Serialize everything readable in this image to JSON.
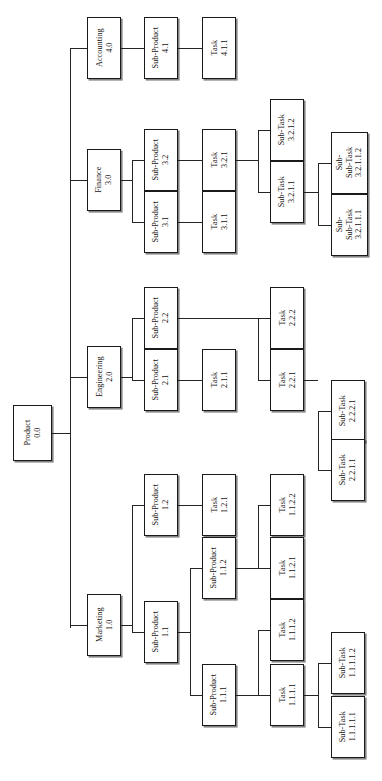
{
  "diagram": {
    "orientation": "horizontal-rotated-labels",
    "line_color": "#242424",
    "box_border_color": "#1a1a1a",
    "box_fill_color": "#ffffff",
    "text_color": "#14100e"
  },
  "nodes": [
    {
      "id": "n0",
      "label": "Product",
      "code": "0.0",
      "x": 13,
      "y": 405,
      "w": 39,
      "h": 56,
      "level": 0
    },
    {
      "id": "n40",
      "label": "Accounting",
      "code": "4.0",
      "x": 87,
      "y": 17,
      "w": 34,
      "h": 62,
      "level": 1
    },
    {
      "id": "n41",
      "label": "Sub-Product",
      "code": "4.1",
      "x": 144,
      "y": 17,
      "w": 34,
      "h": 62,
      "level": 2
    },
    {
      "id": "n411",
      "label": "Task",
      "code": "4.1.1",
      "x": 202,
      "y": 17,
      "w": 34,
      "h": 62,
      "level": 3
    },
    {
      "id": "n30",
      "label": "Finance",
      "code": "3.0",
      "x": 87,
      "y": 149,
      "w": 34,
      "h": 62,
      "level": 1
    },
    {
      "id": "n32",
      "label": "Sub-Product",
      "code": "3.2",
      "x": 144,
      "y": 129,
      "w": 34,
      "h": 62,
      "level": 2
    },
    {
      "id": "n31",
      "label": "Sub-Product",
      "code": "3.1",
      "x": 144,
      "y": 191,
      "w": 34,
      "h": 62,
      "level": 2
    },
    {
      "id": "n321",
      "label": "Task",
      "code": "3.2.1",
      "x": 202,
      "y": 129,
      "w": 34,
      "h": 62,
      "level": 3
    },
    {
      "id": "n311",
      "label": "Task",
      "code": "3.1.1",
      "x": 202,
      "y": 191,
      "w": 34,
      "h": 62,
      "level": 3
    },
    {
      "id": "n3212",
      "label": "Sub-Task",
      "code": "3.2.1.2",
      "x": 270,
      "y": 99,
      "w": 34,
      "h": 62,
      "level": 4
    },
    {
      "id": "n3211",
      "label": "Sub-Task",
      "code": "3.2.1.1",
      "x": 270,
      "y": 161,
      "w": 34,
      "h": 62,
      "level": 4
    },
    {
      "id": "n32112",
      "label": "Sub-\nSub-Task",
      "code": "3.2.1.1.2",
      "x": 331,
      "y": 132,
      "w": 37,
      "h": 62,
      "level": 5
    },
    {
      "id": "n32111",
      "label": "Sub-\nSub-Task",
      "code": "3.2.1.1.1",
      "x": 331,
      "y": 194,
      "w": 37,
      "h": 62,
      "level": 5
    },
    {
      "id": "n20",
      "label": "Engineering",
      "code": "2.0",
      "x": 87,
      "y": 346,
      "w": 34,
      "h": 62,
      "level": 1
    },
    {
      "id": "n22",
      "label": "Sub-Product",
      "code": "2.2",
      "x": 144,
      "y": 287,
      "w": 34,
      "h": 62,
      "level": 2
    },
    {
      "id": "n21",
      "label": "Sub-Product",
      "code": "2.1",
      "x": 144,
      "y": 349,
      "w": 34,
      "h": 62,
      "level": 2
    },
    {
      "id": "n211",
      "label": "Task",
      "code": "2.1.1",
      "x": 202,
      "y": 349,
      "w": 34,
      "h": 62,
      "level": 3
    },
    {
      "id": "n222",
      "label": "Task",
      "code": "2.2.2",
      "x": 270,
      "y": 287,
      "w": 34,
      "h": 62,
      "level": 4
    },
    {
      "id": "n221",
      "label": "Task",
      "code": "2.2.1",
      "x": 270,
      "y": 349,
      "w": 34,
      "h": 62,
      "level": 4
    },
    {
      "id": "n2221",
      "label": "Sub-Task",
      "code": "2.2.2.1",
      "x": 331,
      "y": 380,
      "w": 34,
      "h": 62,
      "level": 5
    },
    {
      "id": "n2211",
      "label": "Sub-Task",
      "code": "2.2.1.1",
      "x": 331,
      "y": 439,
      "w": 34,
      "h": 62,
      "level": 5
    },
    {
      "id": "n10",
      "label": "Marketing",
      "code": "1.0",
      "x": 87,
      "y": 594,
      "w": 34,
      "h": 62,
      "level": 1
    },
    {
      "id": "n12",
      "label": "Sub-Product",
      "code": "1.2",
      "x": 144,
      "y": 474,
      "w": 34,
      "h": 62,
      "level": 2
    },
    {
      "id": "n11",
      "label": "Sub-Product",
      "code": "1.1",
      "x": 144,
      "y": 601,
      "w": 34,
      "h": 62,
      "level": 2
    },
    {
      "id": "n121",
      "label": "Task",
      "code": "1.2.1",
      "x": 202,
      "y": 474,
      "w": 34,
      "h": 62,
      "level": 3
    },
    {
      "id": "n112",
      "label": "Sub-Product",
      "code": "1.1.2",
      "x": 202,
      "y": 537,
      "w": 34,
      "h": 62,
      "level": 3
    },
    {
      "id": "n111",
      "label": "Sub-Product",
      "code": "1.1.1",
      "x": 202,
      "y": 664,
      "w": 34,
      "h": 62,
      "level": 3
    },
    {
      "id": "n1122",
      "label": "Task",
      "code": "1.1.2.2",
      "x": 270,
      "y": 474,
      "w": 34,
      "h": 62,
      "level": 4
    },
    {
      "id": "n1121",
      "label": "Task",
      "code": "1.1.2.1",
      "x": 270,
      "y": 537,
      "w": 34,
      "h": 62,
      "level": 4
    },
    {
      "id": "n1112",
      "label": "Task",
      "code": "1.1.1.2",
      "x": 270,
      "y": 599,
      "w": 34,
      "h": 62,
      "level": 4
    },
    {
      "id": "n1111",
      "label": "Task",
      "code": "1.1.1.1",
      "x": 270,
      "y": 664,
      "w": 34,
      "h": 62,
      "level": 4
    },
    {
      "id": "n11112",
      "label": "Sub-Task",
      "code": "1.1.1.1.2",
      "x": 331,
      "y": 632,
      "w": 34,
      "h": 62,
      "level": 5
    },
    {
      "id": "n11111",
      "label": "Sub-Task",
      "code": "1.1.1.1.1",
      "x": 331,
      "y": 696,
      "w": 34,
      "h": 62,
      "level": 5
    }
  ],
  "edges": [
    {
      "id": "e-root-trunk-v",
      "type": "v",
      "x": 70,
      "y": 48,
      "len": 580
    },
    {
      "id": "e-root-stub",
      "type": "h",
      "x": 52,
      "y": 433,
      "len": 18
    },
    {
      "id": "e-acct-in",
      "type": "h",
      "x": 70,
      "y": 48,
      "len": 17
    },
    {
      "id": "e-acct-41",
      "type": "h",
      "x": 121,
      "y": 48,
      "len": 23
    },
    {
      "id": "e-41-411",
      "type": "h",
      "x": 178,
      "y": 48,
      "len": 24
    },
    {
      "id": "e-fin-in",
      "type": "h",
      "x": 70,
      "y": 180,
      "len": 17
    },
    {
      "id": "e-fin-out",
      "type": "h",
      "x": 121,
      "y": 180,
      "len": 11
    },
    {
      "id": "e-fin-v",
      "type": "v",
      "x": 132,
      "y": 160,
      "len": 62
    },
    {
      "id": "e-fin-32",
      "type": "h",
      "x": 132,
      "y": 160,
      "len": 12
    },
    {
      "id": "e-fin-31",
      "type": "h",
      "x": 132,
      "y": 222,
      "len": 12
    },
    {
      "id": "e-32-321",
      "type": "h",
      "x": 178,
      "y": 160,
      "len": 24
    },
    {
      "id": "e-31-311",
      "type": "h",
      "x": 178,
      "y": 222,
      "len": 24
    },
    {
      "id": "e-321-out",
      "type": "h",
      "x": 236,
      "y": 160,
      "len": 22
    },
    {
      "id": "e-321-v",
      "type": "v",
      "x": 258,
      "y": 130,
      "len": 62
    },
    {
      "id": "e-321-3212",
      "type": "h",
      "x": 258,
      "y": 130,
      "len": 12
    },
    {
      "id": "e-321-3211",
      "type": "h",
      "x": 258,
      "y": 192,
      "len": 12
    },
    {
      "id": "e-3211-out",
      "type": "h",
      "x": 304,
      "y": 192,
      "len": 14
    },
    {
      "id": "e-3211-v",
      "type": "v",
      "x": 318,
      "y": 163,
      "len": 62
    },
    {
      "id": "e-3211-c2",
      "type": "h",
      "x": 318,
      "y": 163,
      "len": 13
    },
    {
      "id": "e-3211-c1",
      "type": "h",
      "x": 318,
      "y": 225,
      "len": 13
    },
    {
      "id": "e-eng-in",
      "type": "h",
      "x": 70,
      "y": 377,
      "len": 17
    },
    {
      "id": "e-eng-out",
      "type": "h",
      "x": 121,
      "y": 377,
      "len": 11
    },
    {
      "id": "e-eng-v",
      "type": "v",
      "x": 132,
      "y": 318,
      "len": 62
    },
    {
      "id": "e-eng-22",
      "type": "h",
      "x": 132,
      "y": 318,
      "len": 12
    },
    {
      "id": "e-eng-21",
      "type": "h",
      "x": 132,
      "y": 380,
      "len": 12
    },
    {
      "id": "e-21-211",
      "type": "h",
      "x": 178,
      "y": 380,
      "len": 24
    },
    {
      "id": "e-22-out",
      "type": "h",
      "x": 178,
      "y": 318,
      "len": 80
    },
    {
      "id": "e-22-v",
      "type": "v",
      "x": 258,
      "y": 318,
      "len": 62
    },
    {
      "id": "e-22-222",
      "type": "h",
      "x": 258,
      "y": 318,
      "len": 12
    },
    {
      "id": "e-22-221",
      "type": "h",
      "x": 258,
      "y": 380,
      "len": 12
    },
    {
      "id": "e-221-out",
      "type": "h",
      "x": 304,
      "y": 380,
      "len": 14
    },
    {
      "id": "e-221-v",
      "type": "v",
      "x": 318,
      "y": 411,
      "len": 59
    },
    {
      "id": "e-221-2221",
      "type": "h",
      "x": 318,
      "y": 411,
      "len": 13
    },
    {
      "id": "e-221-2211",
      "type": "h",
      "x": 318,
      "y": 470,
      "len": 13
    },
    {
      "id": "e-mkt-in",
      "type": "h",
      "x": 70,
      "y": 625,
      "len": 17
    },
    {
      "id": "e-mkt-out",
      "type": "h",
      "x": 121,
      "y": 625,
      "len": 11
    },
    {
      "id": "e-mkt-v",
      "type": "v",
      "x": 132,
      "y": 505,
      "len": 127
    },
    {
      "id": "e-mkt-12",
      "type": "h",
      "x": 132,
      "y": 505,
      "len": 12
    },
    {
      "id": "e-mkt-11",
      "type": "h",
      "x": 132,
      "y": 632,
      "len": 12
    },
    {
      "id": "e-12-121",
      "type": "h",
      "x": 178,
      "y": 505,
      "len": 24
    },
    {
      "id": "e-11-out",
      "type": "h",
      "x": 178,
      "y": 632,
      "len": 12
    },
    {
      "id": "e-11-v",
      "type": "v",
      "x": 190,
      "y": 568,
      "len": 127
    },
    {
      "id": "e-11-112",
      "type": "h",
      "x": 190,
      "y": 568,
      "len": 12
    },
    {
      "id": "e-11-111",
      "type": "h",
      "x": 190,
      "y": 695,
      "len": 12
    },
    {
      "id": "e-112-out",
      "type": "h",
      "x": 236,
      "y": 568,
      "len": 22
    },
    {
      "id": "e-112-v",
      "type": "v",
      "x": 258,
      "y": 505,
      "len": 63
    },
    {
      "id": "e-112-1122",
      "type": "h",
      "x": 258,
      "y": 505,
      "len": 12
    },
    {
      "id": "e-112-1121",
      "type": "h",
      "x": 258,
      "y": 568,
      "len": 12
    },
    {
      "id": "e-111-out",
      "type": "h",
      "x": 236,
      "y": 695,
      "len": 22
    },
    {
      "id": "e-111-v",
      "type": "v",
      "x": 258,
      "y": 630,
      "len": 65
    },
    {
      "id": "e-111-1112",
      "type": "h",
      "x": 258,
      "y": 630,
      "len": 12
    },
    {
      "id": "e-111-1111",
      "type": "h",
      "x": 258,
      "y": 695,
      "len": 12
    },
    {
      "id": "e-1111-out",
      "type": "h",
      "x": 304,
      "y": 695,
      "len": 14
    },
    {
      "id": "e-1111-v",
      "type": "v",
      "x": 318,
      "y": 663,
      "len": 64
    },
    {
      "id": "e-1111-s2",
      "type": "h",
      "x": 318,
      "y": 663,
      "len": 13
    },
    {
      "id": "e-1111-s1",
      "type": "h",
      "x": 318,
      "y": 727,
      "len": 13
    }
  ]
}
